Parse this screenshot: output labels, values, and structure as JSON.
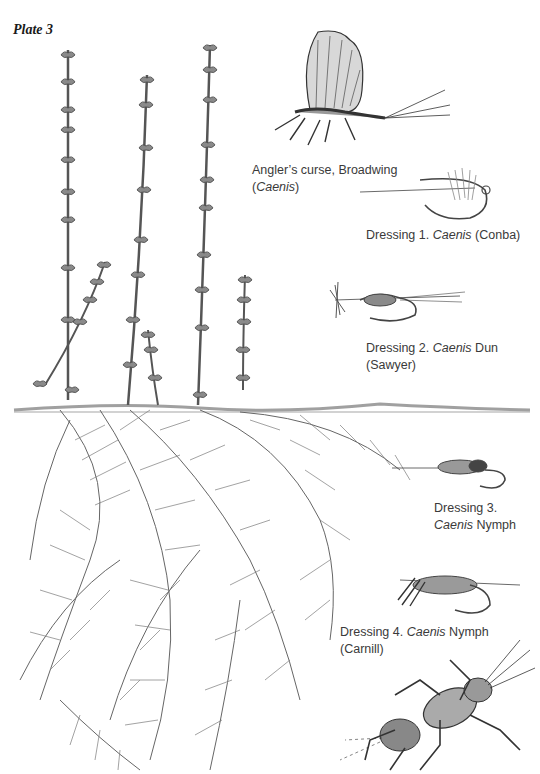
{
  "plate": {
    "title": "Plate 3"
  },
  "captions": [
    {
      "id": "adult",
      "line1_pre": "Angler’s curse, Broadwing",
      "line2_italic": "Caenis",
      "line2_pre": "(",
      "line2_post": ")"
    },
    {
      "id": "dressing1",
      "pre": "Dressing 1. ",
      "italic": "Caenis",
      "post": " (Conba)"
    },
    {
      "id": "dressing2",
      "pre": "Dressing 2. ",
      "italic": "Caenis",
      "post": " Dun (Sawyer)"
    },
    {
      "id": "dressing3",
      "line1": "Dressing 3.",
      "italic": "Caenis",
      "post": " Nymph"
    },
    {
      "id": "dressing4",
      "pre": "Dressing 4. ",
      "italic": "Caenis",
      "post": " Nymph",
      "line2": "(Carnill)"
    }
  ],
  "illustrations": [
    {
      "name": "water-weed-plant",
      "label": "aquatic plant with emergent flower spikes"
    },
    {
      "name": "caenis-adult",
      "label": "Caenis adult (broadwing)"
    },
    {
      "name": "fly-dressing-1",
      "label": "Conba dry fly"
    },
    {
      "name": "fly-dressing-2",
      "label": "Sawyer dun"
    },
    {
      "name": "fly-dressing-3",
      "label": "Caenis nymph fly"
    },
    {
      "name": "fly-dressing-4",
      "label": "Carnill nymph fly"
    },
    {
      "name": "caenis-nymph",
      "label": "Caenis nymph"
    }
  ],
  "colors": {
    "ink": "#3a3a3a",
    "pencil": "#555555",
    "light": "#9a9a9a"
  }
}
